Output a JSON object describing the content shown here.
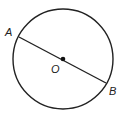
{
  "diagram": {
    "type": "circle-with-diameter",
    "circle": {
      "cx": 63,
      "cy": 59,
      "r": 50,
      "stroke": "#222222"
    },
    "center": {
      "label": "O",
      "x": 63,
      "y": 59
    },
    "points": [
      {
        "label": "A",
        "x": 19,
        "y": 37
      },
      {
        "label": "B",
        "x": 106,
        "y": 83
      }
    ],
    "segment": {
      "from": "A",
      "to": "B",
      "description": "diameter through O"
    }
  }
}
